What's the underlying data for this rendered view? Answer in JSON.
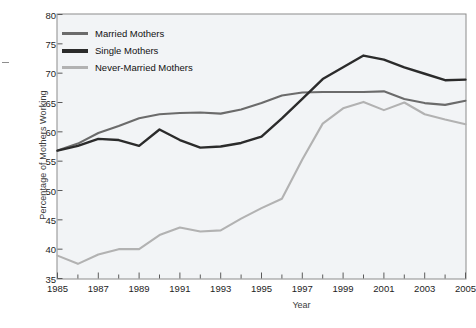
{
  "chart_data": {
    "type": "line",
    "title": "",
    "xlabel": "Year",
    "ylabel": "Percentage of Mothers Working",
    "xlim": [
      1985,
      2005
    ],
    "ylim": [
      35,
      80
    ],
    "yticks": [
      35,
      40,
      45,
      50,
      55,
      60,
      65,
      70,
      75,
      80
    ],
    "xticks": [
      1985,
      1987,
      1989,
      1991,
      1993,
      1995,
      1997,
      1999,
      2001,
      2003,
      2005
    ],
    "x_minor_tick_interval": 1,
    "grid": false,
    "legend_position": "upper-left-inside",
    "x": [
      1985,
      1986,
      1987,
      1988,
      1989,
      1990,
      1991,
      1992,
      1993,
      1994,
      1995,
      1996,
      1997,
      1998,
      1999,
      2000,
      2001,
      2002,
      2003,
      2004,
      2005
    ],
    "series": [
      {
        "name": "Married Mothers",
        "color": "#6b6b6b",
        "values": [
          56.8,
          58.0,
          59.8,
          61.0,
          62.3,
          63.0,
          63.2,
          63.3,
          63.1,
          63.8,
          64.9,
          66.2,
          66.7,
          66.8,
          66.8,
          66.8,
          66.9,
          65.6,
          64.9,
          64.6,
          65.3
        ]
      },
      {
        "name": "Single Mothers",
        "color": "#2b2b2b",
        "values": [
          56.8,
          57.6,
          58.8,
          58.6,
          57.6,
          60.4,
          58.6,
          57.3,
          57.5,
          58.1,
          59.2,
          62.3,
          65.6,
          69.0,
          71.0,
          73.0,
          72.3,
          71.0,
          69.9,
          68.8,
          68.9
        ]
      },
      {
        "name": "Never-Married Mothers",
        "color": "#b2b2b2",
        "values": [
          38.9,
          37.5,
          39.1,
          40.0,
          40.0,
          42.4,
          43.7,
          43.0,
          43.2,
          45.2,
          47.0,
          48.6,
          55.3,
          61.4,
          64.0,
          65.1,
          63.7,
          65.0,
          63.0,
          62.1,
          61.3
        ]
      }
    ]
  },
  "legend": {
    "items": [
      {
        "label": "Married Mothers",
        "color": "#6b6b6b"
      },
      {
        "label": "Single Mothers",
        "color": "#2b2b2b"
      },
      {
        "label": "Never-Married Mothers",
        "color": "#b2b2b2"
      }
    ]
  },
  "axes": {
    "y_title": "Percentage of Mothers Working",
    "x_title": "Year"
  },
  "colors": {
    "plot_background": "#f2f4f6",
    "frame": "#8c8c8c",
    "text": "#1d1d1d",
    "page_background": "#ffffff"
  }
}
